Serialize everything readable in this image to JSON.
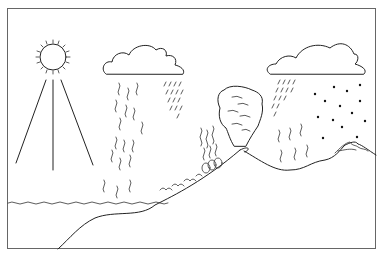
{
  "diagram": {
    "elements": [
      {
        "id": "sun",
        "label": "sun"
      },
      {
        "id": "sun-rays",
        "label": "sun rays"
      },
      {
        "id": "rain-cloud-left",
        "label": "rain cloud"
      },
      {
        "id": "rain-left",
        "label": "rain"
      },
      {
        "id": "ocean",
        "label": "ocean surface"
      },
      {
        "id": "evaporation",
        "label": "evaporation"
      },
      {
        "id": "trees",
        "label": "trees"
      },
      {
        "id": "volcano-plume",
        "label": "volcanic ash cloud"
      },
      {
        "id": "mountain",
        "label": "volcano / mountain"
      },
      {
        "id": "rain-cloud-right",
        "label": "rain and snow cloud"
      },
      {
        "id": "snow",
        "label": "snowfall"
      },
      {
        "id": "snowcap",
        "label": "snow-capped peak"
      },
      {
        "id": "shoreline",
        "label": "sea floor / shoreline"
      }
    ],
    "colors": {
      "line": "#222222",
      "frame": "#666666",
      "background": "#ffffff"
    }
  }
}
